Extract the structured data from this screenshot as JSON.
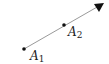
{
  "diagram": {
    "type": "ray",
    "points": [
      {
        "name": "A",
        "subscript": "1",
        "x": 24,
        "y": 49
      },
      {
        "name": "A",
        "subscript": "2",
        "x": 64,
        "y": 25
      }
    ],
    "arrow_tip": {
      "x": 104,
      "y": 3
    },
    "colors": {
      "line": "#9a9a9a",
      "point": "#111111",
      "arrow": "#111111"
    }
  }
}
